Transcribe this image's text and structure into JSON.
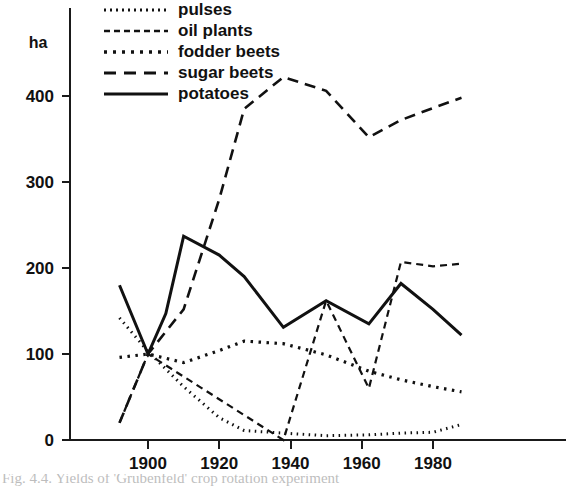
{
  "chart_data": {
    "type": "line",
    "title": "",
    "xlabel": "",
    "ylabel": "ha",
    "ylim": [
      0,
      440
    ],
    "xlim": [
      1890,
      1990
    ],
    "grid": false,
    "legend_position": "top-left",
    "y_unit_label": "ha",
    "y_ticks": [
      0,
      100,
      200,
      300,
      400
    ],
    "y_tick_labels": [
      "0",
      "100",
      "200",
      "300",
      "400"
    ],
    "x_ticks": [
      1900,
      1920,
      1940,
      1960,
      1980
    ],
    "x_tick_labels": [
      "1900",
      "1920",
      "1940",
      "1960",
      "1980"
    ],
    "series": [
      {
        "name": "pulses",
        "style": "fine-dotted",
        "dash": "1.5,4.5",
        "width": 3,
        "x": [
          1892,
          1900,
          1910,
          1920,
          1927,
          1938,
          1950,
          1962,
          1971,
          1980,
          1988
        ],
        "values": [
          142,
          103,
          62,
          26,
          11,
          8,
          5,
          6,
          8,
          9,
          18
        ]
      },
      {
        "name": "oil plants",
        "style": "short-dashed",
        "dash": "7,5",
        "width": 2.2,
        "x": [
          1892,
          1900,
          1938,
          1950,
          1962,
          1971,
          1980,
          1988
        ],
        "values": [
          20,
          100,
          0,
          162,
          60,
          207,
          202,
          205
        ]
      },
      {
        "name": "fodder beets",
        "style": "dotted",
        "dash": "2.5,5.5",
        "width": 3.2,
        "x": [
          1892,
          1900,
          1910,
          1920,
          1927,
          1938,
          1950,
          1962,
          1971,
          1980,
          1988
        ],
        "values": [
          96,
          100,
          90,
          104,
          115,
          112,
          99,
          80,
          70,
          62,
          56
        ]
      },
      {
        "name": "sugar beets",
        "style": "long-dashed",
        "dash": "11,7",
        "width": 2.6,
        "x": [
          1892,
          1900,
          1910,
          1920,
          1927,
          1938,
          1950,
          1962,
          1971,
          1980,
          1988
        ],
        "values": [
          20,
          100,
          152,
          280,
          385,
          422,
          406,
          352,
          372,
          386,
          398
        ]
      },
      {
        "name": "potatoes",
        "style": "solid",
        "dash": "none",
        "width": 3.0,
        "x": [
          1892,
          1900,
          1905,
          1910,
          1920,
          1927,
          1938,
          1950,
          1962,
          1971,
          1980,
          1988
        ],
        "values": [
          180,
          100,
          147,
          237,
          215,
          190,
          131,
          162,
          135,
          182,
          152,
          122
        ]
      }
    ]
  },
  "legend": {
    "items": [
      {
        "label": "pulses",
        "style": "fine-dotted",
        "dash": "2,4",
        "width": 3
      },
      {
        "label": "oil plants",
        "style": "short-dashed",
        "dash": "6,4",
        "width": 2.4
      },
      {
        "label": "fodder beets",
        "style": "dotted",
        "dash": "3,6",
        "width": 3.4
      },
      {
        "label": "sugar beets",
        "style": "long-dashed",
        "dash": "12,8",
        "width": 3
      },
      {
        "label": "potatoes",
        "style": "solid",
        "dash": "none",
        "width": 3.2
      }
    ]
  },
  "caption": {
    "text": "Fig. 4.4. Yields of 'Grubenfeld' crop rotation experiment"
  },
  "colors": {
    "ink": "#111111",
    "background": "#ffffff"
  }
}
